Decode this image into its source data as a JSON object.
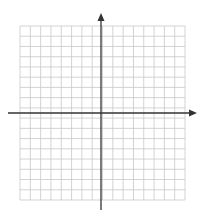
{
  "diagram": {
    "type": "coordinate-plane",
    "grid": {
      "columns": 16,
      "rows": 17,
      "left": 20,
      "top": 26,
      "right": 185,
      "bottom": 200,
      "line_color": "#c8c8c8"
    },
    "axes": {
      "color": "#333333",
      "x_axis": {
        "y": 113,
        "x_start": 8,
        "x_end": 197,
        "arrow": "right"
      },
      "y_axis": {
        "x": 101,
        "y_start": 13,
        "y_end": 210,
        "arrow": "up"
      }
    }
  }
}
